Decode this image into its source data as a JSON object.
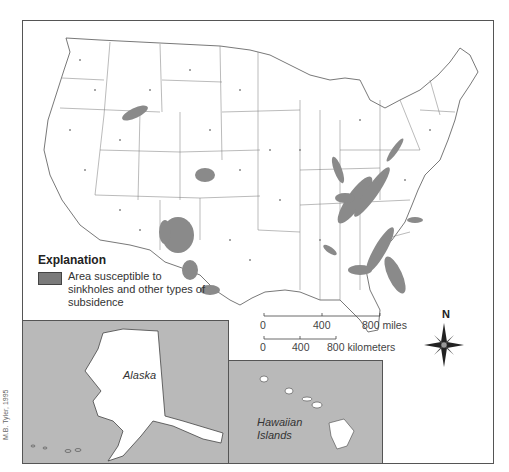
{
  "map": {
    "subject": "Contiguous United States, Alaska, and Hawaii",
    "colors": {
      "land": "#ffffff",
      "border": "#555555",
      "susceptible_area": "#8a8a8a",
      "inset_ocean": "#b9b9b9"
    }
  },
  "legend": {
    "title": "Explanation",
    "items": [
      {
        "label": "Area susceptible to sinkholes and other types of subsidence",
        "color": "#7a7a7a"
      }
    ]
  },
  "scale": {
    "miles": {
      "ticks": [
        "0",
        "400",
        "800 miles"
      ]
    },
    "kilometers": {
      "ticks": [
        "0",
        "400",
        "800 kilometers"
      ]
    }
  },
  "compass": {
    "label": "N",
    "icon": "compass-rose-icon"
  },
  "insets": {
    "alaska": {
      "label": "Alaska"
    },
    "hawaii": {
      "label_line1": "Hawaiian",
      "label_line2": "Islands"
    }
  },
  "credit": "M.B. Tyler, 1995"
}
